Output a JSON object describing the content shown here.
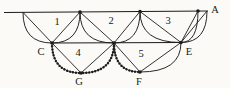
{
  "figure": {
    "background": "#fbfaf7",
    "ink": "#1c1c1c",
    "canvas": {
      "width": 230,
      "height": 88
    },
    "top_line": {
      "x1": 4,
      "y1": 12.5,
      "x2": 208,
      "y2": 11
    },
    "base_line": {
      "from": "C",
      "to": "E"
    },
    "points": {
      "P0": {
        "x": 23,
        "y": 12.4
      },
      "T1": {
        "x": 80,
        "y": 12
      },
      "T2": {
        "x": 140,
        "y": 11.5
      },
      "T3": {
        "x": 198,
        "y": 11
      },
      "P4": {
        "x": 207,
        "y": 11
      },
      "C": {
        "x": 52,
        "y": 43
      },
      "D": {
        "x": 114,
        "y": 43
      },
      "E": {
        "x": 181,
        "y": 42.5
      },
      "G": {
        "x": 81,
        "y": 73
      },
      "F": {
        "x": 140,
        "y": 72
      }
    },
    "dotted_points": [
      "T1",
      "T2",
      "T3",
      "C",
      "D",
      "E",
      "G",
      "F"
    ],
    "dot_radius": 1.8,
    "chords": [
      [
        "P0",
        "C"
      ],
      [
        "T1",
        "C"
      ],
      [
        "T1",
        "D"
      ],
      [
        "T2",
        "D"
      ],
      [
        "T2",
        "E"
      ],
      [
        "T3",
        "E"
      ],
      [
        "P4",
        "E"
      ],
      [
        "C",
        "G"
      ],
      [
        "G",
        "D"
      ],
      [
        "D",
        "F"
      ],
      [
        "F",
        "E"
      ]
    ],
    "arcs": [
      {
        "top": "P0",
        "dip": "C",
        "beaded": false
      },
      {
        "top": "T1",
        "dip": "C",
        "beaded": false
      },
      {
        "top": "T1",
        "dip": "D",
        "beaded": false
      },
      {
        "top": "T2",
        "dip": "D",
        "beaded": false
      },
      {
        "top": "T2",
        "dip": "E",
        "beaded": false
      },
      {
        "top": "T3",
        "dip": "E",
        "beaded": false
      },
      {
        "top": "P4",
        "dip": "E",
        "beaded": false
      },
      {
        "top": "C",
        "dip": "G",
        "beaded": true
      },
      {
        "top": "D",
        "dip": "G",
        "beaded": true
      },
      {
        "top": "D",
        "dip": "F",
        "beaded": true
      },
      {
        "top": "E",
        "dip": "F",
        "beaded": false
      }
    ],
    "labels": [
      {
        "text": "A",
        "x": 215,
        "y": 13,
        "name": "label-A"
      },
      {
        "text": "1",
        "x": 57,
        "y": 24.5,
        "name": "label-region-1"
      },
      {
        "text": "2",
        "x": 111,
        "y": 23.5,
        "name": "label-region-2"
      },
      {
        "text": "3",
        "x": 168,
        "y": 24,
        "name": "label-region-3"
      },
      {
        "text": "4",
        "x": 78,
        "y": 56,
        "name": "label-region-4"
      },
      {
        "text": "5",
        "x": 141,
        "y": 57,
        "name": "label-region-5"
      },
      {
        "text": "C",
        "x": 41,
        "y": 55,
        "name": "label-C"
      },
      {
        "text": "E",
        "x": 189,
        "y": 54.5,
        "name": "label-E"
      },
      {
        "text": "G",
        "x": 79,
        "y": 85,
        "name": "label-G"
      },
      {
        "text": "F",
        "x": 139,
        "y": 85,
        "name": "label-F"
      }
    ],
    "label_font_size": 10.5,
    "stroke_widths": {
      "line": 1.05,
      "chord": 0.9,
      "arc": 0.95,
      "bead_core": 0.7,
      "beads": 2.5
    },
    "bead_dash": "0.01 3.05"
  }
}
